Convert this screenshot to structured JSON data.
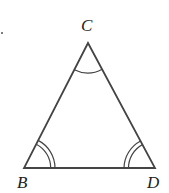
{
  "diagram": {
    "type": "isosceles-triangle",
    "vertices": {
      "C": {
        "label": "C",
        "x": 88,
        "y": 43
      },
      "B": {
        "label": "B",
        "x": 24,
        "y": 168
      },
      "D": {
        "label": "D",
        "x": 155,
        "y": 168
      }
    },
    "angle_marks": {
      "C": {
        "arcs": 1
      },
      "B": {
        "arcs": 2
      },
      "D": {
        "arcs": 2
      }
    },
    "colors": {
      "stroke": "#444444",
      "label": "#222222",
      "background": "#ffffff"
    }
  }
}
